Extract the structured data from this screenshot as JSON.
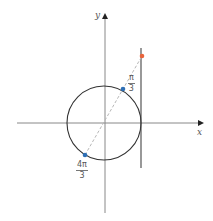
{
  "diagram": {
    "type": "unit-circle-tangent-line",
    "axes": {
      "x_label": "x",
      "y_label": "y"
    },
    "points": [
      {
        "name": "pi-over-3",
        "numerator": "π",
        "denominator": "3",
        "color": "#2e6fb5"
      },
      {
        "name": "four-pi-over-3",
        "numerator": "4π",
        "denominator": "3",
        "color": "#2e6fb5"
      },
      {
        "name": "tangent-intersection",
        "color": "#e8643c"
      }
    ],
    "colors": {
      "axis": "#888888",
      "circle": "#333333",
      "tangent_line": "#444444",
      "dashed_line": "#b8b8b8"
    }
  }
}
